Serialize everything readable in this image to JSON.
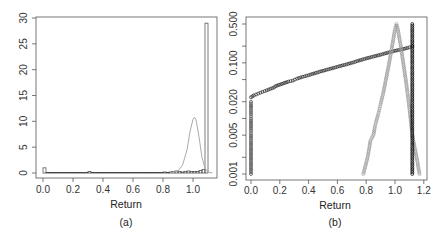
{
  "chart_data": [
    {
      "panel": "(a)",
      "type": "bar",
      "subtype": "histogram with density overlay",
      "title": "",
      "xlabel": "Return",
      "ylabel": "",
      "caption": "(a)",
      "xlim": [
        -0.03,
        1.13
      ],
      "ylim": [
        0,
        30
      ],
      "x_ticks": [
        "0.0",
        "0.2",
        "0.4",
        "0.6",
        "0.8",
        "1.0"
      ],
      "y_ticks": [
        "0",
        "5",
        "10",
        "15",
        "20",
        "25",
        "30"
      ],
      "grid": false,
      "histogram": {
        "bin_edges": [
          0.0,
          0.02,
          0.04,
          0.06,
          0.08,
          0.1,
          0.12,
          0.14,
          0.16,
          0.18,
          0.2,
          0.22,
          0.24,
          0.26,
          0.28,
          0.3,
          0.32,
          0.34,
          0.36,
          0.38,
          0.4,
          0.42,
          0.44,
          0.46,
          0.48,
          0.5,
          0.52,
          0.54,
          0.56,
          0.58,
          0.6,
          0.62,
          0.64,
          0.66,
          0.68,
          0.7,
          0.72,
          0.74,
          0.76,
          0.78,
          0.8,
          0.82,
          0.84,
          0.86,
          0.88,
          0.9,
          0.92,
          0.94,
          0.96,
          0.98,
          1.0,
          1.02,
          1.04,
          1.06,
          1.08,
          1.1
        ],
        "counts": [
          1.0,
          0.1,
          0.1,
          0.1,
          0.1,
          0.1,
          0.1,
          0.1,
          0.1,
          0.1,
          0.1,
          0.1,
          0.1,
          0.1,
          0.1,
          0.3,
          0.1,
          0.1,
          0.1,
          0.1,
          0.1,
          0.1,
          0.1,
          0.1,
          0.1,
          0.1,
          0.1,
          0.1,
          0.1,
          0.1,
          0.1,
          0.1,
          0.1,
          0.1,
          0.1,
          0.1,
          0.1,
          0.1,
          0.1,
          0.1,
          0.2,
          0.1,
          0.2,
          0.3,
          0.4,
          0.3,
          0.2,
          0.3,
          0.4,
          0.3,
          0.3,
          0.3,
          0.5,
          0.7,
          29.0
        ]
      },
      "density_curve": {
        "color": "#aaaaaa",
        "x": [
          0.85,
          0.9,
          0.93,
          0.96,
          0.98,
          1.0,
          1.01,
          1.02,
          1.04,
          1.06,
          1.08,
          1.1,
          1.13
        ],
        "y": [
          0.0,
          0.4,
          1.5,
          4.5,
          8.0,
          10.4,
          10.8,
          10.3,
          7.0,
          3.0,
          0.9,
          0.2,
          0.0
        ]
      }
    },
    {
      "panel": "(b)",
      "type": "scatter",
      "title": "",
      "xlabel": "Return",
      "ylabel": "",
      "caption": "(b)",
      "xlim": [
        -0.03,
        1.23
      ],
      "ylim_log": [
        0.0008,
        0.6
      ],
      "y_scale": "log",
      "x_ticks": [
        "0.0",
        "0.2",
        "0.4",
        "0.6",
        "0.8",
        "1.0",
        "1.2"
      ],
      "y_ticks": [
        "0.001",
        "0.005",
        "0.020",
        "0.100",
        "0.500"
      ],
      "y_minor_ticks": [
        0.002,
        0.01,
        0.05,
        0.2
      ],
      "grid": false,
      "series": [
        {
          "name": "empirical-rising-line",
          "color": "#222222",
          "marker": "open-circle",
          "x": [
            0.0,
            0.02,
            0.05,
            0.08,
            0.11,
            0.16,
            0.17,
            0.26,
            0.29,
            0.32,
            0.36,
            0.4,
            0.45,
            0.5,
            0.55,
            0.6,
            0.65,
            0.7,
            0.75,
            0.8,
            0.85,
            0.9,
            0.95,
            1.0,
            1.05,
            1.1,
            1.12
          ],
          "y": [
            0.024,
            0.026,
            0.028,
            0.03,
            0.032,
            0.036,
            0.038,
            0.046,
            0.048,
            0.052,
            0.056,
            0.06,
            0.066,
            0.072,
            0.078,
            0.085,
            0.092,
            0.1,
            0.11,
            0.12,
            0.13,
            0.14,
            0.152,
            0.165,
            0.175,
            0.19,
            0.2
          ]
        },
        {
          "name": "vertical-at-zero",
          "color": "#444444",
          "marker": "open-circle",
          "x": [
            0.0,
            0.0,
            0.0,
            0.0,
            0.0,
            0.0,
            0.0,
            0.0,
            0.0,
            0.0,
            0.0,
            0.0
          ],
          "y": [
            0.001,
            0.002,
            0.003,
            0.004,
            0.005,
            0.006,
            0.007,
            0.008,
            0.01,
            0.012,
            0.015,
            0.02
          ]
        },
        {
          "name": "gray-peak",
          "color": "#999999",
          "marker": "open-circle",
          "x": [
            0.78,
            0.81,
            0.83,
            0.85,
            0.86,
            0.87,
            0.88,
            0.89,
            0.9,
            0.92,
            0.94,
            0.96,
            0.98,
            1.0,
            1.01,
            1.02,
            1.04,
            1.06,
            1.08,
            1.1,
            1.12,
            1.15,
            1.17
          ],
          "y": [
            0.001,
            0.002,
            0.004,
            0.005,
            0.007,
            0.009,
            0.011,
            0.014,
            0.018,
            0.03,
            0.055,
            0.1,
            0.2,
            0.4,
            0.5,
            0.4,
            0.2,
            0.09,
            0.04,
            0.015,
            0.005,
            0.002,
            0.001
          ]
        },
        {
          "name": "black-vertical-at-1.12",
          "color": "#000000",
          "marker": "open-circle",
          "x": [
            1.12,
            1.12,
            1.12,
            1.12,
            1.12,
            1.12,
            1.12,
            1.12,
            1.12,
            1.12,
            1.12,
            1.12,
            1.12,
            1.12,
            1.12,
            1.12
          ],
          "y": [
            0.001,
            0.002,
            0.003,
            0.004,
            0.005,
            0.006,
            0.008,
            0.01,
            0.015,
            0.02,
            0.04,
            0.07,
            0.1,
            0.2,
            0.35,
            0.5
          ]
        }
      ]
    }
  ]
}
